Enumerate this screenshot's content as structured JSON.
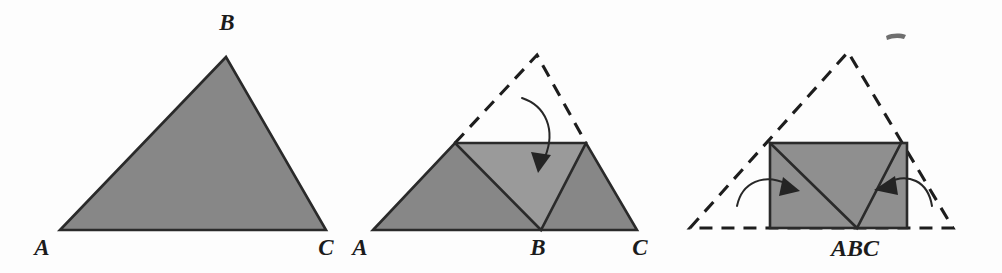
{
  "figure": {
    "background_color": "#fdfdfd",
    "stroke_color": "#2a2a2a",
    "fill_dark": "#878787",
    "fill_light": "#9a9a9a",
    "panels": [
      {
        "id": "panel-1",
        "caption": "Original triangle ABC",
        "labels": [
          {
            "key": "apex",
            "text": "B",
            "x": 227,
            "y": 30
          },
          {
            "key": "left",
            "text": "A",
            "x": 42,
            "y": 255
          },
          {
            "key": "right",
            "text": "C",
            "x": 326,
            "y": 255
          }
        ]
      },
      {
        "id": "panel-2",
        "caption": "Midline fold: apex turned down to the base",
        "labels": [
          {
            "key": "left",
            "text": "A",
            "x": 358,
            "y": 255
          },
          {
            "key": "middle",
            "text": "B",
            "x": 532,
            "y": 255
          },
          {
            "key": "right",
            "text": "C",
            "x": 636,
            "y": 255
          }
        ]
      },
      {
        "id": "panel-3",
        "caption": "Side flaps folded in to form the rectangle",
        "labels": [
          {
            "key": "composite",
            "text": "ABC",
            "x": 855,
            "y": 256
          }
        ]
      }
    ]
  }
}
